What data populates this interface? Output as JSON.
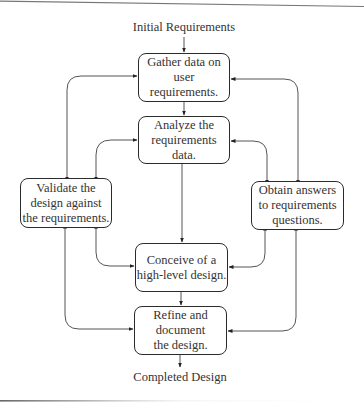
{
  "diagram": {
    "type": "flowchart",
    "input_label": "Initial Requirements",
    "output_label": "Completed Design",
    "nodes": [
      {
        "id": "gather",
        "text": "Gather data on\nuser requirements."
      },
      {
        "id": "analyze",
        "text": "Analyze the\nrequirements data."
      },
      {
        "id": "validate",
        "text": "Validate the\ndesign against\nthe requirements."
      },
      {
        "id": "obtain",
        "text": "Obtain answers\nto requirements\nquestions."
      },
      {
        "id": "conceive",
        "text": "Conceive of a\nhigh-level design."
      },
      {
        "id": "refine",
        "text": "Refine and\ndocument\nthe design."
      }
    ],
    "edges": [
      {
        "from": "input",
        "to": "gather",
        "type": "one-way"
      },
      {
        "from": "gather",
        "to": "analyze",
        "type": "one-way"
      },
      {
        "from": "analyze",
        "to": "conceive",
        "type": "one-way"
      },
      {
        "from": "conceive",
        "to": "refine",
        "type": "one-way"
      },
      {
        "from": "refine",
        "to": "output",
        "type": "one-way"
      },
      {
        "from": "validate",
        "to": "gather",
        "type": "two-way"
      },
      {
        "from": "validate",
        "to": "analyze",
        "type": "two-way"
      },
      {
        "from": "validate",
        "to": "conceive",
        "type": "two-way"
      },
      {
        "from": "validate",
        "to": "refine",
        "type": "two-way"
      },
      {
        "from": "obtain",
        "to": "gather",
        "type": "two-way"
      },
      {
        "from": "obtain",
        "to": "analyze",
        "type": "two-way"
      },
      {
        "from": "obtain",
        "to": "conceive",
        "type": "two-way"
      },
      {
        "from": "obtain",
        "to": "refine",
        "type": "two-way"
      }
    ],
    "colors": {
      "stroke": "#2b2b2b",
      "connector": "#555555",
      "background": "#ffffff"
    }
  }
}
